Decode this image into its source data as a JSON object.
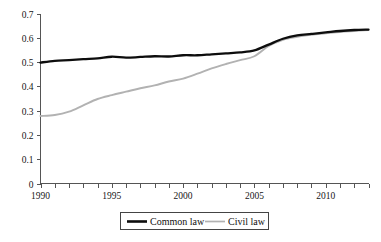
{
  "chart_data": {
    "type": "line",
    "title": "",
    "subtitle": "",
    "xlabel": "",
    "ylabel": "",
    "xlim": [
      1990,
      2013
    ],
    "ylim": [
      0,
      0.7
    ],
    "grid": false,
    "legend_position": "bottom",
    "y_ticks": [
      "0",
      "0.1",
      "0.2",
      "0.3",
      "0.4",
      "0.5",
      "0.6",
      "0.7"
    ],
    "y_tick_values": [
      0,
      0.1,
      0.2,
      0.3,
      0.4,
      0.5,
      0.6,
      0.7
    ],
    "x_ticks_labeled": [
      "1990",
      "1995",
      "2000",
      "2005",
      "2010"
    ],
    "x_tick_values": [
      1990,
      1991,
      1992,
      1993,
      1994,
      1995,
      1996,
      1997,
      1998,
      1999,
      2000,
      2001,
      2002,
      2003,
      2004,
      2005,
      2006,
      2007,
      2008,
      2009,
      2010,
      2011,
      2012,
      2013
    ],
    "x": [
      1990,
      1991,
      1992,
      1993,
      1994,
      1995,
      1996,
      1997,
      1998,
      1999,
      2000,
      2001,
      2002,
      2003,
      2004,
      2005,
      2006,
      2007,
      2008,
      2009,
      2010,
      2011,
      2012,
      2013
    ],
    "series": [
      {
        "name": "Common law",
        "color": "#0d0d0d",
        "values": [
          0.498,
          0.505,
          0.508,
          0.512,
          0.515,
          0.522,
          0.518,
          0.521,
          0.524,
          0.523,
          0.528,
          0.528,
          0.532,
          0.536,
          0.54,
          0.548,
          0.572,
          0.596,
          0.61,
          0.616,
          0.622,
          0.628,
          0.632,
          0.634
        ]
      },
      {
        "name": "Civil law",
        "color": "#b2b2b2",
        "values": [
          0.278,
          0.282,
          0.296,
          0.322,
          0.348,
          0.364,
          0.378,
          0.392,
          0.404,
          0.42,
          0.432,
          0.452,
          0.474,
          0.492,
          0.508,
          0.524,
          0.566,
          0.592,
          0.604,
          0.612,
          0.618,
          0.624,
          0.628,
          0.632
        ]
      }
    ]
  },
  "legend": {
    "entries": [
      {
        "label": "Common law",
        "style": "thick-black-line"
      },
      {
        "label": "Civil law",
        "style": "thin-gray-line"
      }
    ]
  }
}
